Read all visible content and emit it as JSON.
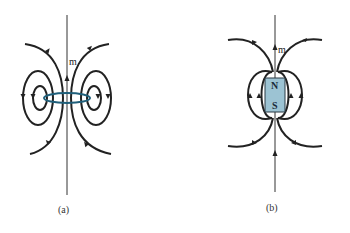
{
  "panels": [
    {
      "id": "a",
      "caption": "(a)",
      "vector_label": "m",
      "source": "current-loop",
      "loop_color": "#1f5f7a"
    },
    {
      "id": "b",
      "caption": "(b)",
      "vector_label": "m",
      "source": "bar-magnet",
      "magnet_color": "#9cc3d3",
      "poles": {
        "north": "N",
        "south": "S"
      }
    }
  ]
}
